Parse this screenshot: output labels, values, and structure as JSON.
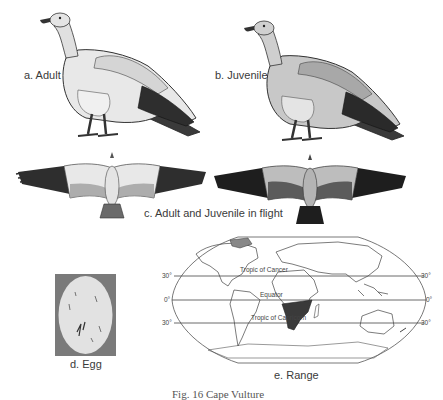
{
  "figure": {
    "caption": "Fig. 16 Cape Vulture",
    "panels": [
      {
        "id": "a",
        "label": "a. Adult"
      },
      {
        "id": "b",
        "label": "b. Juvenile"
      },
      {
        "id": "c",
        "label": "c. Adult and Juvenile in flight"
      },
      {
        "id": "d",
        "label": "d. Egg"
      },
      {
        "id": "e",
        "label": "e. Range"
      }
    ]
  },
  "map": {
    "lines": {
      "tropic_cancer": "Tropic of Cancer",
      "equator": "Equator",
      "tropic_capricorn": "Tropic of Capricorn"
    },
    "lat_labels": {
      "n30_left": "30°",
      "eq_left": "0°",
      "s30_left": "30°",
      "n30_right": "30°",
      "eq_right": "0°",
      "s30_right": "30°"
    },
    "range_region": "Southern Africa",
    "range_color": "#3a3a3a"
  },
  "colors": {
    "background": "#ffffff",
    "plumage_light": "#e6e6e6",
    "plumage_mid": "#b8b8b8",
    "plumage_dark": "#2e2e2e",
    "egg_bg": "#7a7a7a",
    "egg_shell": "#e0e0e0"
  }
}
